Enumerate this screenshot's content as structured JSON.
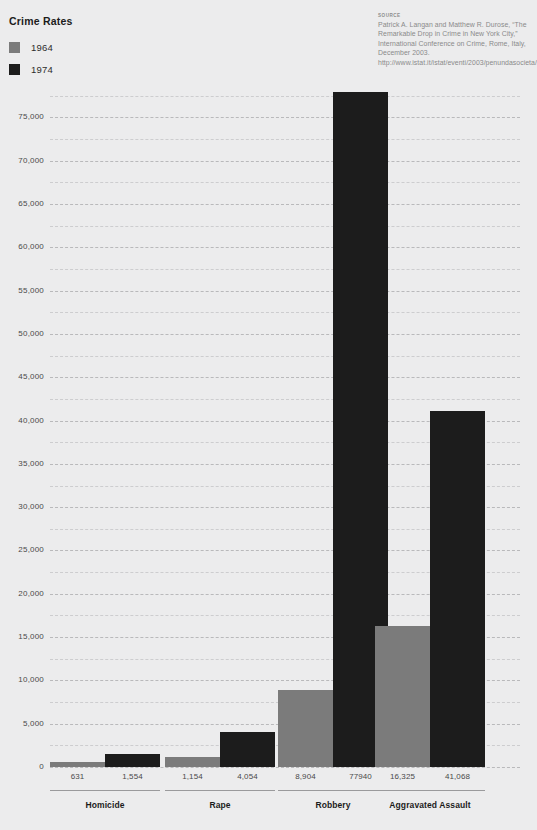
{
  "header": {
    "title": "Crime Rates"
  },
  "legend": {
    "items": [
      {
        "label": "1964",
        "color": "#7b7b7b"
      },
      {
        "label": "1974",
        "color": "#1c1c1c"
      }
    ]
  },
  "source": {
    "heading": "SOURCE",
    "text": "Patrick A. Langan and Matthew R. Durose, “The Remarkable Drop in Crime in New York City,” International Conference on Crime, Rome, Italy, December 2003. http://www.istat.it/istat/eventi/2003/penundasocieta/relazioni/langan_ref.pdf"
  },
  "chart_data": {
    "type": "bar",
    "title": "Crime Rates",
    "xlabel": "",
    "ylabel": "",
    "ylim": [
      0,
      80000
    ],
    "grid": true,
    "legend_position": "top-left",
    "categories": [
      "Homicide",
      "Rape",
      "Robbery",
      "Aggravated Assault"
    ],
    "series": [
      {
        "name": "1964",
        "color": "#7b7b7b",
        "values": [
          631,
          1154,
          8904,
          16325
        ]
      },
      {
        "name": "1974",
        "color": "#1c1c1c",
        "values": [
          1554,
          4054,
          77940,
          41068
        ]
      }
    ],
    "value_labels": [
      [
        "631",
        "1,554"
      ],
      [
        "1,154",
        "4,054"
      ],
      [
        "8,904",
        "77940"
      ],
      [
        "16,325",
        "41,068"
      ]
    ],
    "ytick_labels": [
      "0",
      "5,000",
      "10,000",
      "15,000",
      "20,000",
      "25,000",
      "30,000",
      "35,000",
      "40,000",
      "45,000",
      "50,000",
      "55,000",
      "60,000",
      "65,000",
      "70,000",
      "75,000"
    ],
    "ytick_values": [
      0,
      5000,
      10000,
      15000,
      20000,
      25000,
      30000,
      35000,
      40000,
      45000,
      50000,
      55000,
      60000,
      65000,
      70000,
      75000
    ],
    "minor_gridline_values": [
      2500,
      7500,
      12500,
      17500,
      22500,
      27500,
      32500,
      37500,
      42500,
      47500,
      52500,
      57500,
      62500,
      67500,
      72500,
      77500
    ]
  }
}
